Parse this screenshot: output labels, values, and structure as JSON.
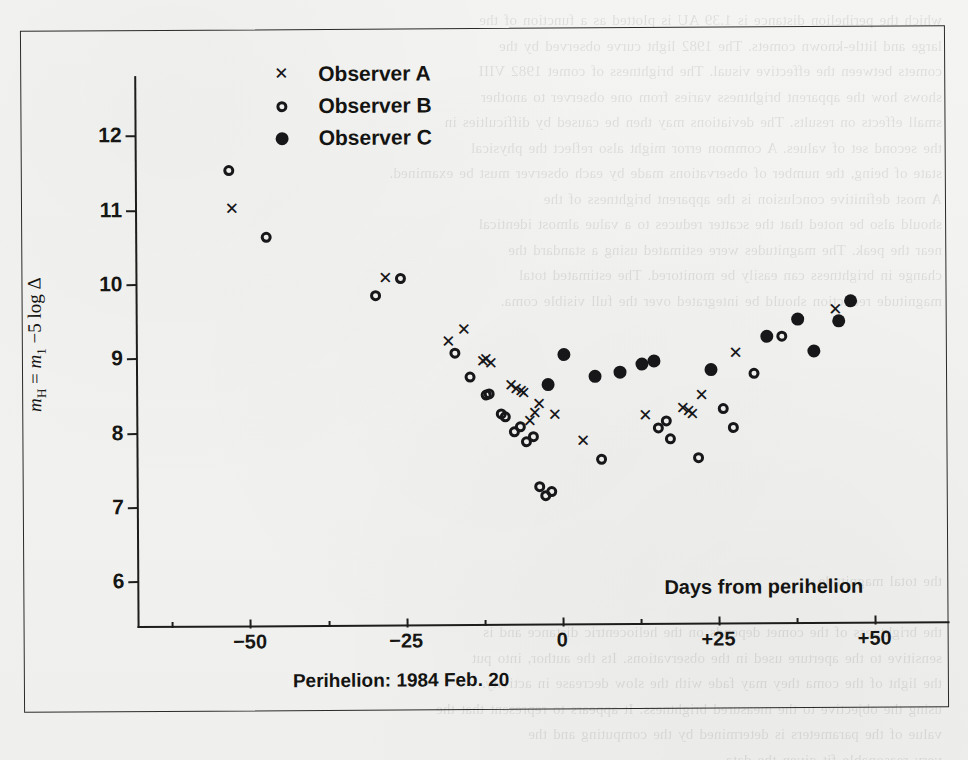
{
  "figure": {
    "background_color": "#f3f3f1",
    "ink_color": "#17171a",
    "ghost_text": "which the perihelion distance is 1.39 AU is plotted as a function of the\nlarge and little-known comets. The 1982 light curve observed by the\ncomets between the effective visual. The brightness of comet 1982 VIII\nshows how the apparent brightness varies from one observer to another\nsmall effects on results. The deviations may then be caused by difficulties in\nthe second set of values. A common error might also reflect the physical\nstate of being, the number of observations made by each observer must be examined.\nA most definitive conclusion is the apparent brightness of the\nshould also be noted that the scatter reduces to a value almost identical\nnear the peak. The magnitudes were estimated using a standard the\nchange in brightness can easily be monitored. The estimated total\nmagnitude reduction should be integrated over the full visible coma.\n\n\n\n\n\n\n\n\n\n\nthe total magnitude\n\nthe brightness of the comet depends on the heliocentric distance and is\nsensitive to the aperture used in the observations. Its the author, into put\nthe light of the coma they may fade with the slow decrease in activity.\nusing the objective to the measured brightness. It appears to represent that the\nvalue of the parameters is determined by the computing and the\nvery reasonable fit given the data."
  },
  "chart_data": {
    "type": "scatter",
    "title": "",
    "xlabel": "Days from perihelion",
    "ylabel": "mH = m1 −5 log Δ",
    "subtitle": "Perihelion: 1984 Feb. 20",
    "xlim": [
      -68,
      62
    ],
    "ylim": [
      12.8,
      5.4
    ],
    "y_inverted": true,
    "grid": false,
    "xticks": [
      -50,
      -25,
      0,
      25,
      50
    ],
    "xticklabels": [
      "−50",
      "−25",
      "0",
      "+25",
      "+50"
    ],
    "xticks_minor": [
      -62.5,
      -37.5,
      -12.5,
      12.5,
      37.5
    ],
    "yticks": [
      6,
      7,
      8,
      9,
      10,
      11,
      12
    ],
    "yticklabels": [
      "6",
      "7",
      "8",
      "9",
      "10",
      "11",
      "12"
    ],
    "legend_position": "top-left-inside",
    "series": [
      {
        "name": "Observer A",
        "marker": "x",
        "points": [
          [
            -52.5,
            11.0
          ],
          [
            -28.0,
            10.05
          ],
          [
            -18.0,
            9.2
          ],
          [
            -15.5,
            9.35
          ],
          [
            -12.5,
            8.92
          ],
          [
            -12.0,
            8.95
          ],
          [
            -11.2,
            8.9
          ],
          [
            -8.0,
            8.6
          ],
          [
            -7.2,
            8.55
          ],
          [
            -6.4,
            8.52
          ],
          [
            -6.0,
            8.5
          ],
          [
            -5.0,
            8.12
          ],
          [
            -4.2,
            8.22
          ],
          [
            -3.5,
            8.35
          ],
          [
            -1.0,
            8.2
          ],
          [
            3.5,
            7.85
          ],
          [
            13.5,
            8.18
          ],
          [
            19.5,
            8.28
          ],
          [
            20.4,
            8.24
          ],
          [
            21.0,
            8.2
          ],
          [
            22.5,
            8.45
          ],
          [
            28.0,
            9.02
          ],
          [
            44.0,
            9.6
          ]
        ]
      },
      {
        "name": "Observer B",
        "marker": "o",
        "points": [
          [
            -53.0,
            11.52
          ],
          [
            -47.0,
            10.62
          ],
          [
            -29.5,
            9.82
          ],
          [
            -25.5,
            10.05
          ],
          [
            -17.0,
            9.05
          ],
          [
            -14.5,
            8.72
          ],
          [
            -12.0,
            8.48
          ],
          [
            -11.5,
            8.5
          ],
          [
            -9.5,
            8.22
          ],
          [
            -9.0,
            8.18
          ],
          [
            -7.5,
            7.98
          ],
          [
            -6.5,
            8.05
          ],
          [
            -5.5,
            7.85
          ],
          [
            -4.5,
            7.92
          ],
          [
            -3.5,
            7.25
          ],
          [
            -2.5,
            7.12
          ],
          [
            -1.5,
            7.18
          ],
          [
            6.5,
            7.6
          ],
          [
            15.5,
            8.02
          ],
          [
            16.8,
            8.12
          ],
          [
            17.5,
            7.88
          ],
          [
            22.0,
            7.62
          ],
          [
            26.0,
            8.28
          ],
          [
            27.5,
            8.02
          ],
          [
            31.0,
            8.75
          ],
          [
            35.5,
            9.25
          ]
        ]
      },
      {
        "name": "Observer C",
        "marker": "●",
        "points": [
          [
            -2.0,
            8.62
          ],
          [
            0.5,
            9.02
          ],
          [
            5.5,
            8.72
          ],
          [
            9.5,
            8.78
          ],
          [
            13.0,
            8.88
          ],
          [
            15.0,
            8.92
          ],
          [
            24.0,
            8.8
          ],
          [
            33.0,
            9.25
          ],
          [
            38.0,
            9.48
          ],
          [
            40.5,
            9.05
          ],
          [
            44.5,
            9.45
          ],
          [
            46.5,
            9.72
          ]
        ]
      }
    ]
  },
  "legend": {
    "items": [
      {
        "label": "Observer A",
        "marker": "cross"
      },
      {
        "label": "Observer B",
        "marker": "open-circle"
      },
      {
        "label": "Observer C",
        "marker": "filled-circle"
      }
    ]
  }
}
